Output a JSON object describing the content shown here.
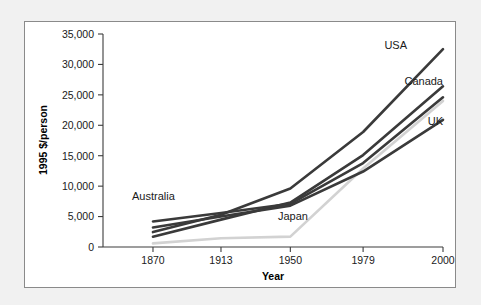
{
  "chart_data": {
    "type": "line",
    "title": "",
    "xlabel": "Year",
    "ylabel": "1995 $/person",
    "categories": [
      "1870",
      "1913",
      "1950",
      "1979",
      "2000"
    ],
    "x": [
      1870,
      1913,
      1950,
      1979,
      2000
    ],
    "xlim": [
      1870,
      2000
    ],
    "ylim": [
      0,
      35000
    ],
    "yticks": [
      "0",
      "5,000",
      "10,000",
      "15,000",
      "20,000",
      "25,000",
      "30,000",
      "35,000"
    ],
    "ytick_values": [
      0,
      5000,
      10000,
      15000,
      20000,
      25000,
      30000,
      35000
    ],
    "grid": false,
    "legend_position": "inline-end-labels",
    "series": [
      {
        "name": "USA",
        "label": "USA",
        "color": "#3a3a3a",
        "values": [
          2450,
          5300,
          9600,
          18900,
          32500
        ]
      },
      {
        "name": "Canada",
        "label": "Canada",
        "color": "#3a3a3a",
        "values": [
          1700,
          4500,
          7300,
          15100,
          26400
        ]
      },
      {
        "name": "Australia",
        "label": "Australia",
        "color": "#3a3a3a",
        "values": [
          4200,
          5600,
          7100,
          13800,
          24600
        ]
      },
      {
        "name": "UK",
        "label": "UK",
        "color": "#3a3a3a",
        "values": [
          3200,
          5000,
          6800,
          12400,
          20900
        ]
      },
      {
        "name": "Japan",
        "label": "Japan",
        "color": "#d2d2d2",
        "values": [
          600,
          1450,
          1700,
          12900,
          24000
        ]
      }
    ],
    "annotations": [
      {
        "text": "Australia",
        "series": "Australia"
      },
      {
        "text": "Japan",
        "series": "Japan"
      },
      {
        "text": "USA",
        "series": "USA"
      },
      {
        "text": "Canada",
        "series": "Canada"
      },
      {
        "text": "UK",
        "series": "UK"
      }
    ]
  }
}
